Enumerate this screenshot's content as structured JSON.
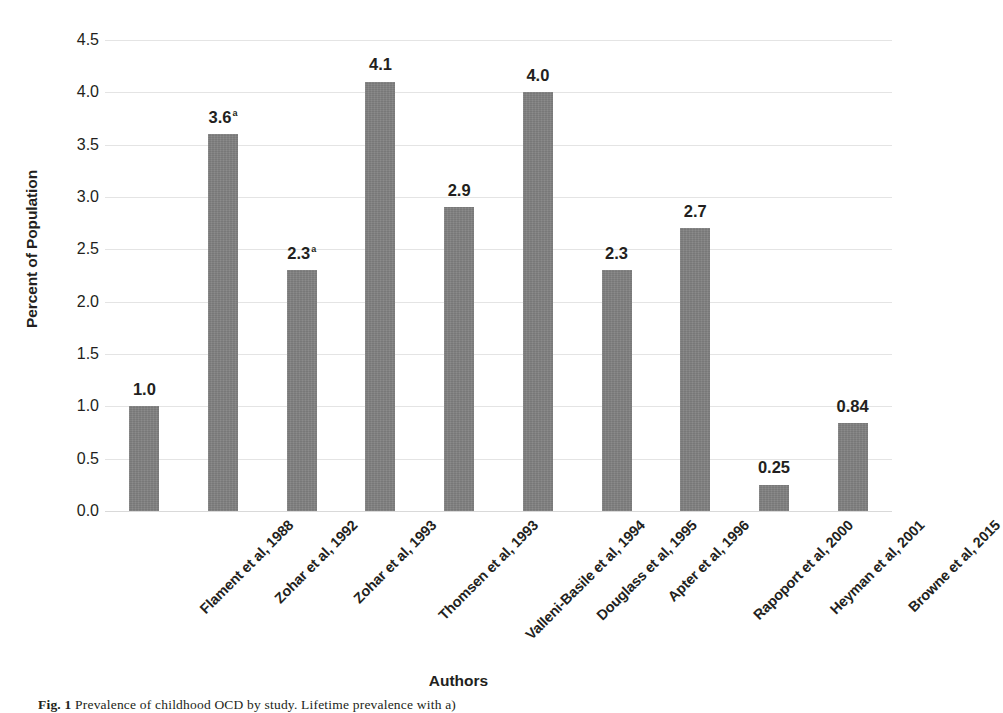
{
  "chart_data": {
    "type": "bar",
    "title": "",
    "xlabel": "Authors",
    "ylabel": "Percent of Population",
    "ylim": [
      0.0,
      4.5
    ],
    "ytick_labels": [
      "0.0",
      "0.5",
      "1.0",
      "1.5",
      "2.0",
      "2.5",
      "3.0",
      "3.5",
      "4.0",
      "4.5"
    ],
    "ytick_values": [
      0.0,
      0.5,
      1.0,
      1.5,
      2.0,
      2.5,
      3.0,
      3.5,
      4.0,
      4.5
    ],
    "grid": "horizontal",
    "legend": "none",
    "bar_color": "#808080",
    "categories": [
      "Flament et al, 1988",
      "Zohar et al, 1992",
      "Zohar et al, 1993",
      "Thomsen et al, 1993",
      "Valleni-Basile et al, 1994",
      "Douglass et al, 1995",
      "Apter et al, 1996",
      "Rapoport et al, 2000",
      "Heyman et al, 2001",
      "Browne et al, 2015"
    ],
    "values": [
      1.0,
      3.6,
      2.3,
      4.1,
      2.9,
      4.0,
      2.3,
      2.7,
      0.25,
      0.84
    ],
    "value_labels": [
      "1.0",
      "3.6",
      "2.3",
      "4.1",
      "2.9",
      "4.0",
      "2.3",
      "2.7",
      "0.25",
      "0.84"
    ],
    "value_label_footnotes": [
      "",
      "a",
      "a",
      "",
      "",
      "",
      "",
      "",
      "",
      ""
    ],
    "annotations": [
      "Superscript 'a' marks values from Zohar et al, 1992 and Zohar et al, 1993"
    ]
  },
  "caption": {
    "figure_number": "Fig. 1",
    "text": "Prevalence of childhood OCD by study. Lifetime prevalence with a)  ",
    "full": "Fig. 1 Prevalence of childhood OCD by study. Lifetime prevalence with a)"
  }
}
